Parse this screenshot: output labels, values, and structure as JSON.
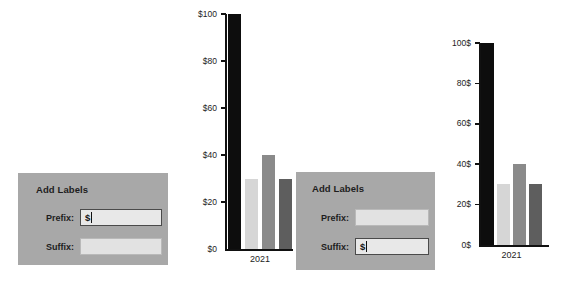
{
  "dialogs": [
    {
      "title": "Add Labels",
      "prefix_label": "Prefix:",
      "prefix_value": "$",
      "prefix_focused": true,
      "suffix_label": "Suffix:",
      "suffix_value": "",
      "suffix_focused": false
    },
    {
      "title": "Add Labels",
      "prefix_label": "Prefix:",
      "prefix_value": "",
      "prefix_focused": false,
      "suffix_label": "Suffix:",
      "suffix_value": "$",
      "suffix_focused": true
    }
  ],
  "colors": {
    "dialog_background": "#a8a8a8",
    "input_background": "#e2e2e2",
    "bar_black": "#0d0d0d",
    "bar_light": "#d6d6d6",
    "bar_medium": "#8a8a8a",
    "bar_dark": "#5e5e5e",
    "axis": "#111111"
  },
  "chart_data": [
    {
      "id": "chart-prefix",
      "type": "bar",
      "title": "",
      "xlabel": "",
      "ylabel": "",
      "categories": [
        "2021"
      ],
      "series": [
        {
          "name": "Series 1",
          "values": [
            100
          ],
          "color": "#0d0d0d"
        },
        {
          "name": "Series 2",
          "values": [
            30
          ],
          "color": "#d6d6d6"
        },
        {
          "name": "Series 3",
          "values": [
            40
          ],
          "color": "#8a8a8a"
        },
        {
          "name": "Series 4",
          "values": [
            30
          ],
          "color": "#5e5e5e"
        }
      ],
      "ylim": [
        0,
        100
      ],
      "yticks": [
        0,
        20,
        40,
        60,
        80,
        100
      ],
      "ytick_labels": [
        "$0",
        "$20",
        "$40",
        "$60",
        "$80",
        "$100"
      ],
      "xtick_labels": [
        "2021"
      ],
      "grid": false,
      "legend": "none",
      "label_prefix": "$",
      "label_suffix": ""
    },
    {
      "id": "chart-suffix",
      "type": "bar",
      "title": "",
      "xlabel": "",
      "ylabel": "",
      "categories": [
        "2021"
      ],
      "series": [
        {
          "name": "Series 1",
          "values": [
            100
          ],
          "color": "#0d0d0d"
        },
        {
          "name": "Series 2",
          "values": [
            30
          ],
          "color": "#d6d6d6"
        },
        {
          "name": "Series 3",
          "values": [
            40
          ],
          "color": "#8a8a8a"
        },
        {
          "name": "Series 4",
          "values": [
            30
          ],
          "color": "#5e5e5e"
        }
      ],
      "ylim": [
        0,
        100
      ],
      "yticks": [
        0,
        20,
        40,
        60,
        80,
        100
      ],
      "ytick_labels": [
        "0$",
        "20$",
        "40$",
        "60$",
        "80$",
        "100$"
      ],
      "xtick_labels": [
        "2021"
      ],
      "grid": false,
      "legend": "none",
      "label_prefix": "",
      "label_suffix": "$"
    }
  ]
}
